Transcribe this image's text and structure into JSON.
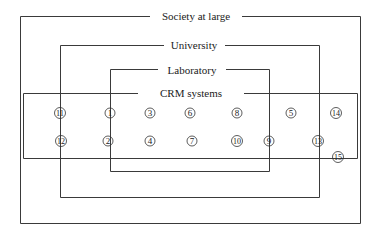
{
  "diagram": {
    "title_labels": {
      "society": "Society at large",
      "university": "University",
      "laboratory": "Laboratory",
      "crm": "CRM systems"
    },
    "boxes": [
      {
        "id": "society",
        "x1": 20,
        "y1": 16,
        "x2": 360,
        "y2": 223,
        "label_x": 196,
        "label_gap": [
          150,
          242
        ]
      },
      {
        "id": "university",
        "x1": 60,
        "y1": 45,
        "x2": 319,
        "y2": 197,
        "label_x": 194,
        "label_gap": [
          164,
          225
        ]
      },
      {
        "id": "laboratory",
        "x1": 110,
        "y1": 69,
        "x2": 269,
        "y2": 171,
        "label_x": 192,
        "label_gap": [
          158,
          226
        ]
      },
      {
        "id": "crm",
        "x1": 23,
        "y1": 93,
        "x2": 357,
        "y2": 158,
        "label_x": 191,
        "label_gap": [
          138,
          244
        ]
      }
    ],
    "nodes": [
      {
        "label": "11",
        "x": 60,
        "y": 113
      },
      {
        "label": "1",
        "x": 110,
        "y": 113
      },
      {
        "label": "3",
        "x": 150,
        "y": 113
      },
      {
        "label": "6",
        "x": 190,
        "y": 113
      },
      {
        "label": "8",
        "x": 237,
        "y": 113
      },
      {
        "label": "5",
        "x": 291,
        "y": 113
      },
      {
        "label": "14",
        "x": 336,
        "y": 113
      },
      {
        "label": "12",
        "x": 61,
        "y": 141
      },
      {
        "label": "2",
        "x": 108,
        "y": 141
      },
      {
        "label": "4",
        "x": 150,
        "y": 141
      },
      {
        "label": "7",
        "x": 192,
        "y": 141
      },
      {
        "label": "10",
        "x": 237,
        "y": 141
      },
      {
        "label": "9",
        "x": 269,
        "y": 141
      },
      {
        "label": "13",
        "x": 318,
        "y": 141
      },
      {
        "label": "15",
        "x": 338,
        "y": 157
      }
    ],
    "colors": {
      "line": "#3a3a3a",
      "text": "#222222",
      "background": "#ffffff"
    }
  }
}
